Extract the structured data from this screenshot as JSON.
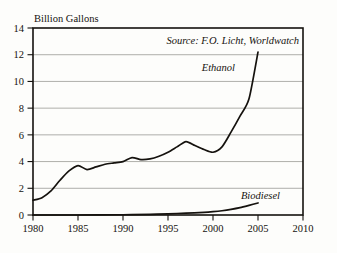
{
  "chart_data": {
    "type": "line",
    "title": "",
    "xlabel": "",
    "ylabel": "Billion Gallons",
    "xlim": [
      1980,
      2010
    ],
    "ylim": [
      0,
      14
    ],
    "xticks": [
      1980,
      1985,
      1990,
      1995,
      2000,
      2005,
      2010
    ],
    "yticks": [
      0,
      2,
      4,
      6,
      8,
      10,
      12,
      14
    ],
    "grid": "horizontal",
    "legend_position": "inline-annotation",
    "annotations": [
      {
        "name": "source",
        "text": "Source: F.O. Licht, Worldwatch"
      }
    ],
    "series": [
      {
        "name": "Ethanol",
        "x": [
          1980,
          1981,
          1982,
          1983,
          1984,
          1985,
          1986,
          1987,
          1988,
          1989,
          1990,
          1991,
          1992,
          1993,
          1994,
          1995,
          1996,
          1997,
          1998,
          1999,
          2000,
          2001,
          2002,
          2003,
          2004,
          2005
        ],
        "values": [
          1.1,
          1.3,
          1.8,
          2.6,
          3.3,
          3.7,
          3.4,
          3.6,
          3.8,
          3.9,
          4.0,
          4.3,
          4.15,
          4.2,
          4.4,
          4.7,
          5.1,
          5.5,
          5.2,
          4.9,
          4.7,
          5.1,
          6.2,
          7.4,
          8.7,
          12.2
        ]
      },
      {
        "name": "Biodiesel",
        "x": [
          1980,
          1985,
          1990,
          1993,
          1995,
          1997,
          1999,
          2000,
          2001,
          2002,
          2003,
          2004,
          2005
        ],
        "values": [
          0.0,
          0.0,
          0.02,
          0.05,
          0.09,
          0.14,
          0.2,
          0.25,
          0.32,
          0.42,
          0.55,
          0.72,
          0.9
        ]
      }
    ]
  },
  "axis": {
    "y_title": "Billion Gallons",
    "y_tick_labels": [
      "0",
      "2",
      "4",
      "6",
      "8",
      "10",
      "12",
      "14"
    ],
    "x_tick_labels": [
      "1980",
      "1985",
      "1990",
      "1995",
      "2000",
      "2005",
      "2010"
    ]
  },
  "labels": {
    "ethanol": "Ethanol",
    "biodiesel": "Biodiesel",
    "source": "Source: F.O. Licht, Worldwatch"
  },
  "colors": {
    "line": "#15120e",
    "grid": "#9a9a96",
    "frame": "#15120e",
    "background": "#fdfdfb"
  }
}
